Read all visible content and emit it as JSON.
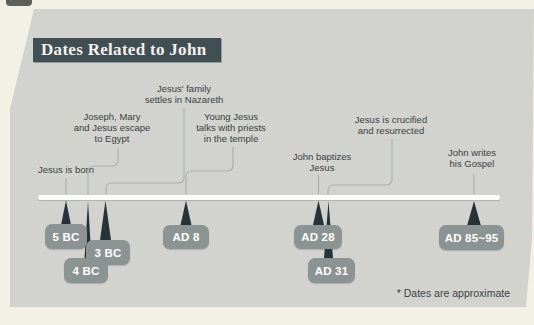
{
  "page": {
    "title": "Dates Related to John",
    "footnote": "* Dates are approximate"
  },
  "timeline": {
    "events": [
      {
        "id": "born",
        "date": "5 BC",
        "lines": [
          "Jesus is born"
        ]
      },
      {
        "id": "egypt",
        "date": "4 BC",
        "lines": [
          "Joseph, Mary",
          "and Jesus escape",
          "to Egypt"
        ]
      },
      {
        "id": "nazareth",
        "date": "3 BC",
        "lines": [
          "Jesus' family",
          "settles in Nazareth"
        ]
      },
      {
        "id": "temple",
        "date": "AD 8",
        "lines": [
          "Young Jesus",
          "talks with priests",
          "in the temple"
        ]
      },
      {
        "id": "baptism",
        "date": "AD 28",
        "lines": [
          "John baptizes",
          "Jesus"
        ]
      },
      {
        "id": "crucifixion",
        "date": "AD 31",
        "lines": [
          "Jesus is crucified",
          "and resurrected"
        ]
      },
      {
        "id": "gospel",
        "date": "AD 85~95",
        "lines": [
          "John writes",
          "his Gospel"
        ]
      }
    ]
  },
  "colors": {
    "page_background": "#f3f0e6",
    "panel_background": "#d2d3cf",
    "title_bar": "#414e54",
    "title_text": "#f2f1ec",
    "label_text": "#3a3f41",
    "leader_line": "#a9b0ad",
    "timeline_bar": "#fbfbf8",
    "marker": "#26343a",
    "badge_background": "#8c9493",
    "badge_text": "#ffffff"
  }
}
